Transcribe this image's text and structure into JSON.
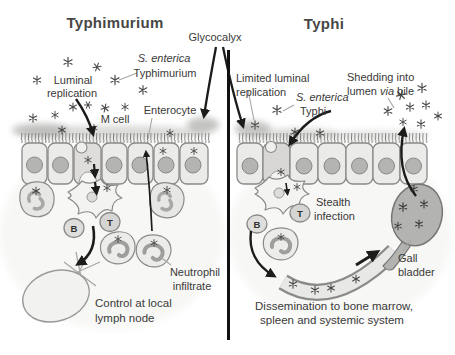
{
  "figure": {
    "center": {
      "glycocalyx_label": "Glycocalyx"
    },
    "left_panel": {
      "title": "Typhimurium",
      "luminal_replication_line1": "Luminal",
      "luminal_replication_line2": "replication",
      "s_enterica_line1": "S. enterica",
      "s_enterica_line2": "Typhimurium",
      "enterocyte_label": "Enterocyte",
      "m_cell_label": "M cell",
      "b_cell_label": "B",
      "t_cell_label": "T",
      "neutrophil_line1": "Neutrophil",
      "neutrophil_line2": "infiltrate",
      "control_line1": "Control at local",
      "control_line2": "lymph node"
    },
    "right_panel": {
      "title": "Typhi",
      "limited_line1": "Limited luminal",
      "limited_line2": "replication",
      "s_enterica_line1": "S. enterica",
      "s_enterica_line2": "Typhi",
      "shedding_line1": "Shedding into",
      "shedding_word1": "lumen",
      "shedding_word2": "via",
      "shedding_word3": "bile",
      "b_cell_label": "B",
      "t_cell_label": "T",
      "stealth_line1": "Stealth",
      "stealth_line2": "infection",
      "gall_line1": "Gall",
      "gall_line2": "bladder",
      "dissemination_line1": "Dissemination to bone marrow,",
      "dissemination_line2": "spleen and systemic system"
    },
    "colors": {
      "ink": "#1c1c1a",
      "text": "#3a3a38",
      "cell_fill": "#ebebe9",
      "cell_stroke": "#8a8a88",
      "nucleus_fill": "#b4b4b2",
      "gall_bladder_fill": "#b3b3b1",
      "vessel_wall": "#8a8a88",
      "background": "#ffffff"
    }
  }
}
